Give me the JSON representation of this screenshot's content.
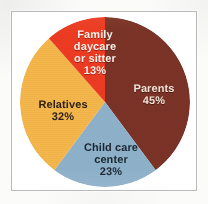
{
  "figure": {
    "frame_border_color": "#b9b9b9",
    "background_color": "#ffffff",
    "page_color": "#fbfbfa"
  },
  "chart_data": {
    "type": "pie",
    "title": "",
    "subtitle": "",
    "xlabel": "",
    "ylabel": "",
    "legend_position": "none",
    "grid": false,
    "start_angle_deg": 0,
    "direction": "clockwise",
    "labels_inside_slices": true,
    "total_percent": 113,
    "categories": [
      "Parents",
      "Child care center",
      "Relatives",
      "Family daycare or sitter"
    ],
    "values": [
      45,
      23,
      32,
      13
    ],
    "value_unit": "%",
    "colors": [
      "#7b3326",
      "#8fb2cc",
      "#f6b74b",
      "#ef3B22"
    ],
    "slices": [
      {
        "name": "Parents",
        "value": 45,
        "value_label": "45%",
        "color": "#7b3326",
        "label_color": "#f0e2d8",
        "label_lines": [
          "Parents",
          "45%"
        ]
      },
      {
        "name": "Child care center",
        "value": 23,
        "value_label": "23%",
        "color": "#8fb2cc",
        "label_color": "#1d2630",
        "label_lines": [
          "Child care",
          "center",
          "23%"
        ]
      },
      {
        "name": "Relatives",
        "value": 32,
        "value_label": "32%",
        "color": "#f6b74b",
        "label_color": "#2c2218",
        "label_lines": [
          "Relatives",
          "32%"
        ]
      },
      {
        "name": "Family daycare or sitter",
        "value": 13,
        "value_label": "13%",
        "color": "#ef3b22",
        "label_color": "#fbf3ec",
        "label_lines": [
          "Family",
          "daycare",
          "or sitter",
          "13%"
        ]
      }
    ]
  },
  "labels": {
    "parents": {
      "line1": "Parents",
      "line2": "45%"
    },
    "family_daycare": {
      "line1": "Family",
      "line2": "daycare",
      "line3": "or sitter",
      "line4": "13%"
    },
    "relatives": {
      "line1": "Relatives",
      "line2": "32%"
    },
    "child_care_center": {
      "line1": "Child care",
      "line2": "center",
      "line3": "23%"
    }
  }
}
